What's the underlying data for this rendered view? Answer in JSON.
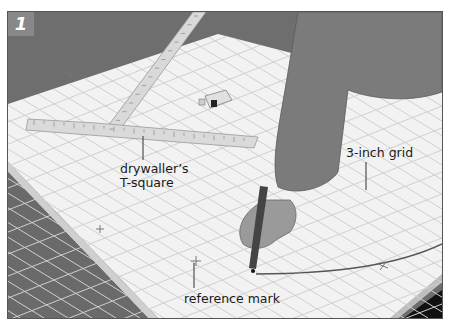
{
  "figure": {
    "step_number": "1",
    "callouts": {
      "tsquare_line1": "drywaller’s",
      "tsquare_line2": "T-square",
      "grid": "3-inch grid",
      "reference": "reference mark"
    },
    "objects": [
      "drywall-panel",
      "drywaller-t-square",
      "tape-measure",
      "pencil",
      "hand",
      "sawhorse",
      "arc-line"
    ],
    "colors": {
      "background": "#6b6b6b",
      "panel": "#f2f2f2",
      "grid_line": "#cfcfcf",
      "ruler": "#d8d8d8",
      "sleeve": "#7a7a7a",
      "shadow": "#2a2a2a",
      "badge": "#888888"
    }
  }
}
